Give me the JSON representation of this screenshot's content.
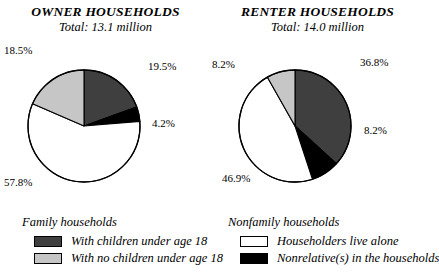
{
  "figure": {
    "background_color": "#ffffff",
    "text_color": "#000000"
  },
  "colors": {
    "with_children": "#3f3f3f",
    "no_children": "#c6c6c6",
    "live_alone": "#ffffff",
    "nonrelatives": "#000000",
    "outline": "#000000"
  },
  "panels": {
    "owner": {
      "title": "OWNER HOUSEHOLDS",
      "subtitle": "Total: 13.1 million",
      "labels": {
        "with_children": "19.5%",
        "nonrelatives": "4.2%",
        "live_alone": "57.8%",
        "no_children": "18.5%"
      }
    },
    "renter": {
      "title": "RENTER HOUSEHOLDS",
      "subtitle": "Total: 14.0 million",
      "labels": {
        "with_children": "36.8%",
        "nonrelatives": "8.2%",
        "live_alone": "46.9%",
        "no_children": "8.2%"
      }
    }
  },
  "legend": {
    "family": {
      "heading": "Family households",
      "items": [
        {
          "label": "With children under age 18",
          "color": "#3f3f3f"
        },
        {
          "label": "With no children under age 18",
          "color": "#c6c6c6"
        }
      ]
    },
    "nonfamily": {
      "heading": "Nonfamily households",
      "items": [
        {
          "label": "Householders live alone",
          "color": "#ffffff"
        },
        {
          "label": "Nonrelative(s) in the households",
          "color": "#000000"
        }
      ]
    }
  },
  "chart_data": [
    {
      "type": "pie",
      "title": "OWNER HOUSEHOLDS",
      "subtitle": "Total: 13.1 million",
      "total": 13.1,
      "total_units": "million households",
      "start_angle_deg": 90,
      "direction": "clockwise",
      "categories": [
        "With children under age 18",
        "Nonrelative(s) in the households",
        "Householders live alone",
        "With no children under age 18"
      ],
      "values": [
        19.5,
        4.2,
        57.8,
        18.5
      ],
      "value_labels": [
        "19.5%",
        "4.2%",
        "57.8%",
        "18.5%"
      ],
      "colors": [
        "#3f3f3f",
        "#000000",
        "#ffffff",
        "#c6c6c6"
      ],
      "groups": [
        "Family households",
        "Nonfamily households",
        "Nonfamily households",
        "Family households"
      ]
    },
    {
      "type": "pie",
      "title": "RENTER HOUSEHOLDS",
      "subtitle": "Total: 14.0 million",
      "total": 14.0,
      "total_units": "million households",
      "start_angle_deg": 90,
      "direction": "clockwise",
      "categories": [
        "With children under age 18",
        "Nonrelative(s) in the households",
        "Householders live alone",
        "With no children under age 18"
      ],
      "values": [
        36.8,
        8.2,
        46.9,
        8.2
      ],
      "value_labels": [
        "36.8%",
        "8.2%",
        "46.9%",
        "8.2%"
      ],
      "colors": [
        "#3f3f3f",
        "#000000",
        "#ffffff",
        "#c6c6c6"
      ],
      "groups": [
        "Family households",
        "Nonfamily households",
        "Nonfamily households",
        "Family households"
      ]
    }
  ]
}
